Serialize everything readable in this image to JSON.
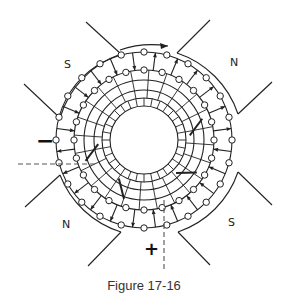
{
  "figure": {
    "caption": "Figure 17-16",
    "center": [
      144,
      140
    ],
    "rotation_direction": "clockwise",
    "colors": {
      "line": "#222222",
      "background": "#ffffff",
      "dash": "#555555"
    }
  },
  "poles": [
    {
      "id": "top-left",
      "label": "S",
      "angle": -135
    },
    {
      "id": "top-right",
      "label": "N",
      "angle": -45
    },
    {
      "id": "bottom-left",
      "label": "N",
      "angle": 135
    },
    {
      "id": "bottom-right",
      "label": "S",
      "angle": 45
    }
  ],
  "brushes": [
    {
      "id": "negative",
      "label": "−",
      "position": "left"
    },
    {
      "id": "positive",
      "label": "+",
      "position": "bottom"
    }
  ]
}
